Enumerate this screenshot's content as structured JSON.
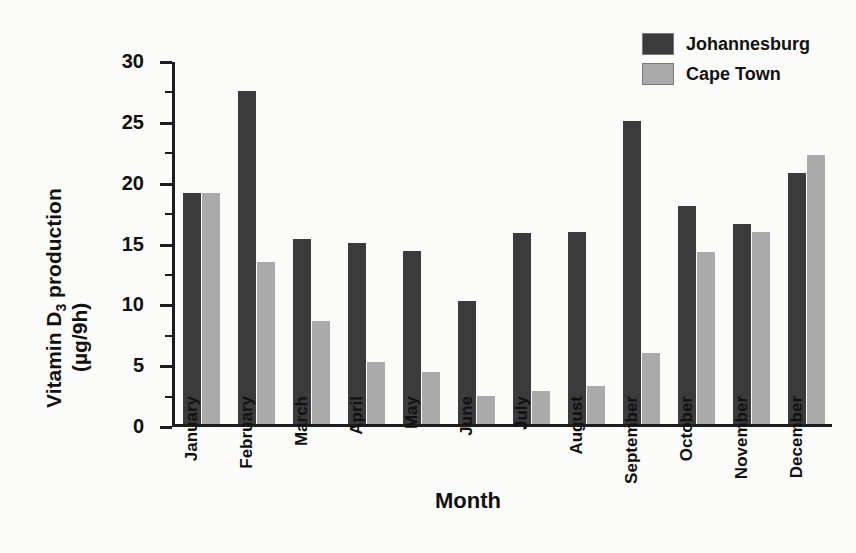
{
  "chart_data": {
    "type": "bar",
    "title": "",
    "xlabel": "Month",
    "ylabel": "Vitamin D 3 production (µg/9h)",
    "ylabel_line1": "Vitamin D",
    "ylabel_subscript": "3",
    "ylabel_line1_tail": "production",
    "ylabel_line2": "(µg/9h)",
    "ylim": [
      0,
      32
    ],
    "ytick_values": [
      0,
      5,
      10,
      15,
      20,
      25,
      30
    ],
    "ytick_labels": [
      "0",
      "5",
      "10",
      "15",
      "20",
      "25",
      "30"
    ],
    "yminor_values": [
      2.5,
      7.5,
      12.5,
      17.5,
      22.5,
      27.5
    ],
    "grid": false,
    "legend_position": "top-right",
    "categories": [
      "January",
      "February",
      "March",
      "April",
      "May",
      "June",
      "July",
      "August",
      "September",
      "October",
      "November",
      "December"
    ],
    "series": [
      {
        "name": "Johannesburg",
        "color": "#3b3b3b",
        "values": [
          19.0,
          27.4,
          15.2,
          14.9,
          14.2,
          10.1,
          15.7,
          15.8,
          24.9,
          17.9,
          16.4,
          20.6
        ]
      },
      {
        "name": "Cape Town",
        "color": "#aaaaaa",
        "values": [
          19.0,
          13.3,
          8.5,
          5.1,
          4.3,
          2.3,
          2.7,
          3.1,
          5.8,
          14.1,
          15.8,
          22.1
        ]
      }
    ]
  },
  "legend": {
    "items": [
      {
        "label": "Johannesburg",
        "color": "#3b3b3b"
      },
      {
        "label": "Cape Town",
        "color": "#aaaaaa"
      }
    ]
  }
}
